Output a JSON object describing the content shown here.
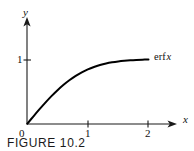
{
  "figure": {
    "caption": "FIGURE 10.2",
    "background_color": "#ffffff",
    "ink_color": "#111111"
  },
  "axes": {
    "y_axis_label": "y",
    "x_axis_label": "x",
    "origin_label": "0",
    "y_ticks": [
      {
        "value": 1,
        "label": "1"
      }
    ],
    "x_ticks": [
      {
        "value": 1,
        "label": "1"
      },
      {
        "value": 2,
        "label": "2"
      }
    ]
  },
  "annotations": {
    "curve_label_function": "erf",
    "curve_label_variable": "x"
  },
  "chart_data": {
    "type": "line",
    "title": "FIGURE 10.2",
    "xlabel": "x",
    "ylabel": "y",
    "xlim": [
      0,
      2.45
    ],
    "ylim": [
      0,
      1.28
    ],
    "grid": false,
    "legend_position": "inline-right-of-curve",
    "xticks": [
      0,
      1,
      2
    ],
    "xticklabels": [
      "0",
      "1",
      "2"
    ],
    "yticks": [
      1
    ],
    "yticklabels": [
      "1"
    ],
    "series": [
      {
        "name": "erf x",
        "x": [
          0,
          0.1,
          0.2,
          0.3,
          0.4,
          0.5,
          0.6,
          0.7,
          0.8,
          0.9,
          1.0,
          1.1,
          1.2,
          1.3,
          1.4,
          1.5,
          1.6,
          1.7,
          1.8,
          1.9,
          2.0
        ],
        "y": [
          0,
          0.1125,
          0.2227,
          0.3286,
          0.4284,
          0.5205,
          0.6039,
          0.6778,
          0.7421,
          0.7969,
          0.8427,
          0.8802,
          0.9103,
          0.934,
          0.9523,
          0.9661,
          0.9763,
          0.9838,
          0.9891,
          0.9928,
          0.9953
        ]
      }
    ],
    "annotations": [
      {
        "text": "erf x",
        "x": 2.12,
        "y": 1.0
      }
    ]
  }
}
